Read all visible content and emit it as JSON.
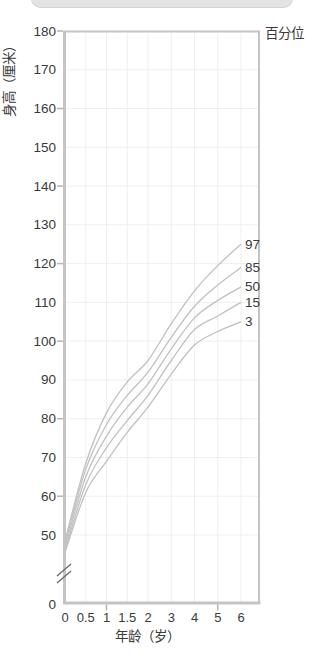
{
  "header": {
    "segmented_pill_visible": true
  },
  "colors": {
    "pill_gray": "#e3e3e3",
    "axis": "#c4c4c4",
    "grid": "#efefef",
    "curve": "#c1c1c1",
    "text": "#3a3a3a",
    "tick": "#b5b5b5",
    "break_mark": "#6b6b6b",
    "background": "#ffffff"
  },
  "chart_data": {
    "type": "line",
    "title": "",
    "legend_title": "百分位",
    "xlabel": "年龄（岁）",
    "ylabel": "身高（厘米）",
    "grid": true,
    "x": [
      0,
      0.5,
      1,
      1.5,
      2,
      3,
      4,
      5,
      6
    ],
    "x_tick_labels": [
      "0",
      "0.5",
      "1",
      "1.5",
      "2",
      "3",
      "4",
      "5",
      "6"
    ],
    "x_ticks_marked": [
      1,
      5
    ],
    "y_tick_labels": [
      180,
      170,
      160,
      150,
      140,
      130,
      120,
      110,
      100,
      90,
      80,
      70,
      60,
      50,
      0
    ],
    "y_ticks_marked": [
      180,
      160,
      140,
      120,
      100,
      80,
      60
    ],
    "y_gridlines": [
      50,
      60,
      70,
      80,
      90,
      100,
      110,
      120,
      130,
      140,
      150,
      160,
      170
    ],
    "x_gridlines": [
      0.5,
      1,
      1.5,
      2,
      3,
      4,
      5,
      6
    ],
    "ylim_display": [
      45,
      180
    ],
    "y_axis_break_below": 45,
    "x_axis_note": "x scale compressed: 0-2 in 0.5y steps, 2-6 in 1y steps",
    "series": [
      {
        "name": "97",
        "values": [
          48.5,
          68.5,
          81.5,
          89.5,
          95.0,
          104.5,
          113.0,
          119.5,
          125.0
        ]
      },
      {
        "name": "85",
        "values": [
          47.6,
          67.0,
          78.5,
          86.0,
          92.0,
          101.0,
          109.0,
          114.5,
          119.0
        ]
      },
      {
        "name": "50",
        "values": [
          46.8,
          65.0,
          75.5,
          83.0,
          89.0,
          98.0,
          106.0,
          110.5,
          114.0
        ]
      },
      {
        "name": "15",
        "values": [
          46.0,
          63.0,
          72.5,
          79.5,
          86.0,
          95.0,
          103.0,
          106.5,
          110.0
        ]
      },
      {
        "name": "3",
        "values": [
          45.5,
          61.0,
          69.0,
          76.5,
          83.0,
          91.5,
          99.0,
          102.5,
          105.0
        ]
      }
    ]
  }
}
